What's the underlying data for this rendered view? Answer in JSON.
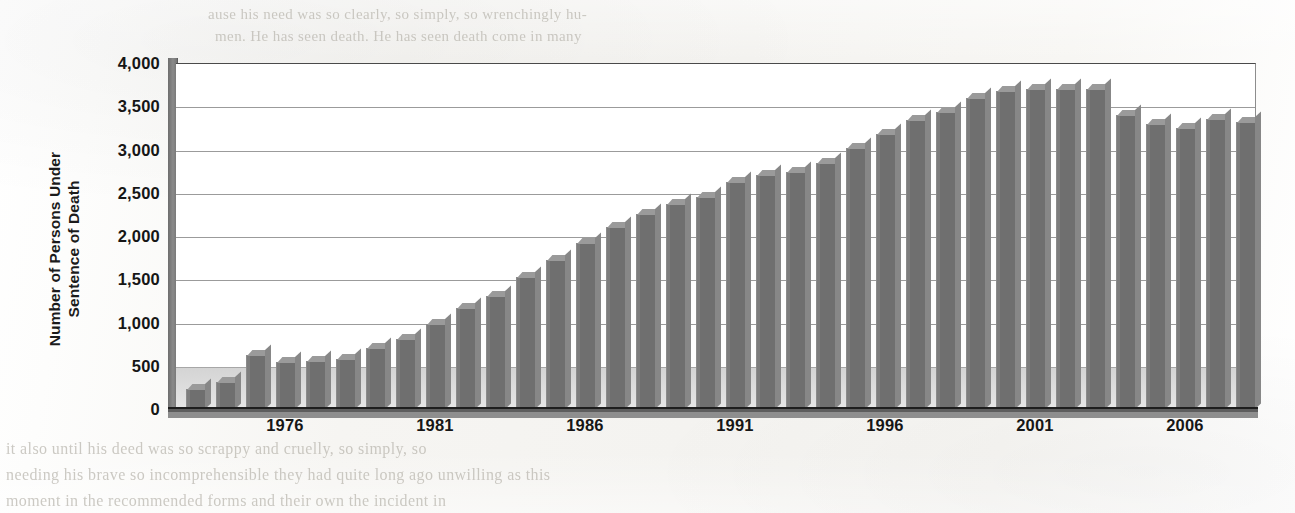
{
  "chart_data": {
    "type": "bar",
    "title": "",
    "xlabel": "",
    "ylabel": "Number of Persons Under Sentence of Death",
    "ylabel_lines": [
      "Number of Persons Under",
      "Sentence of Death"
    ],
    "ylim": [
      0,
      4000
    ],
    "ytick_values": [
      0,
      500,
      1000,
      1500,
      2000,
      2500,
      3000,
      3500,
      4000
    ],
    "ytick_labels": [
      "0",
      "500",
      "1,000",
      "1,500",
      "2,000",
      "2,500",
      "3,000",
      "3,500",
      "4,000"
    ],
    "grid": true,
    "legend": "none",
    "xtick_labels": [
      "1976",
      "1981",
      "1986",
      "1991",
      "1996",
      "2001",
      "2006"
    ],
    "xtick_years": [
      1976,
      1981,
      1986,
      1991,
      1996,
      2001,
      2006
    ],
    "x_range": [
      1973,
      2008
    ],
    "bar_color": "#6f6f6f",
    "categories": [
      "1973",
      "1974",
      "1975",
      "1976",
      "1977",
      "1978",
      "1979",
      "1980",
      "1981",
      "1982",
      "1983",
      "1984",
      "1985",
      "1986",
      "1987",
      "1988",
      "1989",
      "1990",
      "1991",
      "1992",
      "1993",
      "1994",
      "1995",
      "1996",
      "1997",
      "1998",
      "1999",
      "2000",
      "2001",
      "2002",
      "2003",
      "2004",
      "2005",
      "2006",
      "2007",
      "2008"
    ],
    "values": [
      234,
      315,
      627,
      545,
      555,
      574,
      709,
      809,
      978,
      1163,
      1311,
      1525,
      1724,
      1922,
      2108,
      2260,
      2370,
      2450,
      2620,
      2705,
      2740,
      2840,
      3020,
      3180,
      3340,
      3430,
      3600,
      3680,
      3700,
      3700,
      3700,
      3400,
      3300,
      3250,
      3350,
      3320
    ]
  },
  "page_bleed": {
    "top_line_1": "ause his need was so clearly, so simply, so wrenchingly hu-",
    "top_line_2": "men. He has seen death. He has seen death come in many",
    "bottom_line_1": "it also until his deed was so scrappy and cruelly, so simply, so",
    "bottom_line_2": "needing his brave so incomprehensible they had quite long ago unwilling as this",
    "bottom_line_3": "moment in the recommended forms and their own the incident in",
    "mid_line_1": "its own appearance",
    "mid_line_2": "the later reads"
  }
}
